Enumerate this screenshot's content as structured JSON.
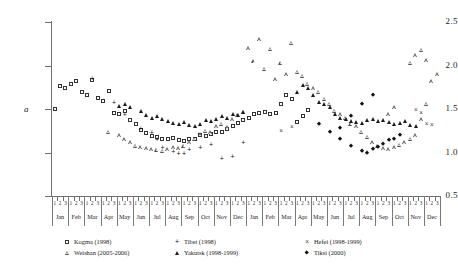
{
  "chart_data": {
    "type": "scatter",
    "title": "",
    "xlabel": "",
    "ylabel": "a",
    "ylim": [
      0.5,
      2.5
    ],
    "ytick_labels": [
      "0.5",
      "1.0",
      "1.5",
      "2.0",
      "2.5"
    ],
    "ytick_values": [
      0.5,
      1.0,
      1.5,
      2.0,
      2.5
    ],
    "grid": false,
    "legend_position": "below-axes",
    "x_axis": {
      "type": "categorical-decades",
      "decade_labels": [
        "1",
        "2",
        "3"
      ],
      "months": [
        "Jan",
        "Feb",
        "Mar",
        "Apr",
        "May",
        "Jun",
        "Jul",
        "Aug",
        "Sep",
        "Oct",
        "Nov",
        "Dec",
        "Jan",
        "Feb",
        "Mar",
        "Apr",
        "May",
        "Jun",
        "Jul",
        "Aug",
        "Sep",
        "Oct",
        "Nov",
        "Dec"
      ],
      "n_months": 24,
      "decades_per_month": 3,
      "total_slots": 72
    },
    "series": [
      {
        "name": "Kogma (1998)",
        "marker": "open-square",
        "points": [
          [
            0,
            1.5
          ],
          [
            1,
            1.76
          ],
          [
            2,
            1.74
          ],
          [
            3,
            1.79
          ],
          [
            4,
            1.82
          ],
          [
            5,
            1.7
          ],
          [
            6,
            1.66
          ],
          [
            7,
            1.83
          ],
          [
            8,
            1.63
          ],
          [
            9,
            1.59
          ],
          [
            10,
            1.71
          ],
          [
            11,
            1.45
          ],
          [
            12,
            1.44
          ],
          [
            13,
            1.48
          ],
          [
            14,
            1.37
          ],
          [
            15,
            1.33
          ],
          [
            16,
            1.26
          ],
          [
            17,
            1.22
          ],
          [
            18,
            1.19
          ],
          [
            19,
            1.18
          ],
          [
            20,
            1.16
          ],
          [
            21,
            1.15
          ],
          [
            22,
            1.17
          ],
          [
            23,
            1.14
          ],
          [
            24,
            1.13
          ],
          [
            25,
            1.16
          ],
          [
            26,
            1.15
          ],
          [
            27,
            1.2
          ],
          [
            28,
            1.19
          ],
          [
            29,
            1.21
          ],
          [
            30,
            1.24
          ],
          [
            31,
            1.23
          ],
          [
            32,
            1.27
          ],
          [
            33,
            1.31
          ],
          [
            34,
            1.34
          ],
          [
            35,
            1.37
          ],
          [
            36,
            1.4
          ],
          [
            37,
            1.44
          ],
          [
            38,
            1.45
          ],
          [
            39,
            1.46
          ],
          [
            40,
            1.44
          ],
          [
            41,
            1.45
          ],
          [
            42,
            1.56
          ],
          [
            43,
            1.66
          ],
          [
            44,
            1.62
          ],
          [
            45,
            1.35
          ],
          [
            46,
            1.42
          ],
          [
            47,
            1.49
          ]
        ]
      },
      {
        "name": "Weishan (2005-2006)",
        "marker": "open-triangle",
        "points": [
          [
            10,
            1.24
          ],
          [
            12,
            1.2
          ],
          [
            13,
            1.15
          ],
          [
            14,
            1.12
          ],
          [
            15,
            1.08
          ],
          [
            16,
            1.06
          ],
          [
            17,
            1.05
          ],
          [
            18,
            1.04
          ],
          [
            19,
            1.03
          ],
          [
            20,
            1.02
          ],
          [
            21,
            1.04
          ],
          [
            22,
            1.06
          ],
          [
            23,
            1.05
          ],
          [
            24,
            1.08
          ],
          [
            25,
            1.12
          ],
          [
            26,
            1.16
          ],
          [
            27,
            1.21
          ],
          [
            28,
            1.25
          ],
          [
            29,
            1.23
          ],
          [
            30,
            1.3
          ],
          [
            31,
            1.33
          ],
          [
            32,
            1.29
          ],
          [
            33,
            1.38
          ],
          [
            34,
            1.43
          ],
          [
            35,
            1.47
          ],
          [
            36,
            2.2
          ],
          [
            37,
            2.05
          ],
          [
            38,
            2.3
          ],
          [
            39,
            1.96
          ],
          [
            40,
            2.19
          ],
          [
            41,
            1.84
          ],
          [
            42,
            2.03
          ],
          [
            43,
            1.9
          ],
          [
            44,
            2.26
          ],
          [
            45,
            1.93
          ],
          [
            46,
            1.88
          ],
          [
            47,
            1.79
          ],
          [
            48,
            1.74
          ],
          [
            49,
            1.7
          ],
          [
            50,
            1.62
          ],
          [
            51,
            1.56
          ],
          [
            52,
            1.48
          ],
          [
            53,
            1.44
          ],
          [
            54,
            1.4
          ],
          [
            55,
            1.33
          ],
          [
            56,
            1.3
          ],
          [
            57,
            1.24
          ],
          [
            58,
            1.18
          ],
          [
            59,
            1.12
          ],
          [
            60,
            1.08
          ],
          [
            61,
            1.05
          ],
          [
            62,
            1.04
          ],
          [
            63,
            1.06
          ],
          [
            64,
            1.09
          ],
          [
            65,
            1.12
          ],
          [
            66,
            1.16
          ],
          [
            67,
            1.2
          ],
          [
            68,
            1.38
          ],
          [
            69,
            1.56
          ],
          [
            70,
            1.82
          ],
          [
            71,
            1.9
          ],
          [
            62,
            1.44
          ],
          [
            63,
            1.52
          ],
          [
            66,
            2.03
          ],
          [
            67,
            2.12
          ],
          [
            68,
            2.18
          ],
          [
            69,
            2.06
          ]
        ]
      },
      {
        "name": "Tibet (1998)",
        "marker": "plus",
        "points": [
          [
            7,
            1.86
          ],
          [
            11,
            1.58
          ],
          [
            13,
            1.44
          ],
          [
            16,
            1.28
          ],
          [
            18,
            1.24
          ],
          [
            19,
            1.15
          ],
          [
            20,
            1.06
          ],
          [
            22,
            1.02
          ],
          [
            23,
            0.99
          ],
          [
            24,
            1.0
          ],
          [
            25,
            1.04
          ],
          [
            27,
            1.06
          ],
          [
            29,
            1.1
          ],
          [
            31,
            0.94
          ],
          [
            33,
            0.96
          ],
          [
            35,
            1.12
          ]
        ]
      },
      {
        "name": "Yakutsk (1998-1999)",
        "marker": "filled-triangle",
        "points": [
          [
            12,
            1.54
          ],
          [
            13,
            1.56
          ],
          [
            14,
            1.52
          ],
          [
            16,
            1.48
          ],
          [
            17,
            1.43
          ],
          [
            18,
            1.4
          ],
          [
            19,
            1.42
          ],
          [
            20,
            1.38
          ],
          [
            21,
            1.36
          ],
          [
            22,
            1.34
          ],
          [
            23,
            1.33
          ],
          [
            24,
            1.35
          ],
          [
            25,
            1.32
          ],
          [
            26,
            1.3
          ],
          [
            27,
            1.33
          ],
          [
            28,
            1.37
          ],
          [
            29,
            1.36
          ],
          [
            30,
            1.38
          ],
          [
            31,
            1.42
          ],
          [
            32,
            1.4
          ],
          [
            33,
            1.44
          ],
          [
            34,
            1.43
          ],
          [
            35,
            1.46
          ],
          [
            45,
            1.7
          ],
          [
            46,
            1.78
          ],
          [
            47,
            1.74
          ],
          [
            48,
            1.66
          ],
          [
            49,
            1.58
          ],
          [
            50,
            1.56
          ],
          [
            51,
            1.52
          ],
          [
            52,
            1.44
          ],
          [
            53,
            1.4
          ],
          [
            54,
            1.38
          ],
          [
            55,
            1.36
          ],
          [
            56,
            1.35
          ],
          [
            57,
            1.34
          ],
          [
            58,
            1.37
          ],
          [
            59,
            1.38
          ],
          [
            60,
            1.36
          ],
          [
            61,
            1.37
          ],
          [
            62,
            1.35
          ],
          [
            63,
            1.33
          ],
          [
            64,
            1.34
          ],
          [
            65,
            1.36
          ],
          [
            66,
            1.32
          ],
          [
            67,
            1.3
          ]
        ]
      },
      {
        "name": "Hefei (1998-1999)",
        "marker": "cross",
        "points": [
          [
            42,
            1.26
          ],
          [
            44,
            1.3
          ],
          [
            67,
            1.5
          ],
          [
            68,
            1.46
          ],
          [
            69,
            1.34
          ],
          [
            70,
            1.33
          ]
        ]
      },
      {
        "name": "Tiksi (2000)",
        "marker": "filled-diamond",
        "points": [
          [
            49,
            1.33
          ],
          [
            51,
            1.24
          ],
          [
            53,
            1.16
          ],
          [
            55,
            1.08
          ],
          [
            57,
            1.02
          ],
          [
            58,
            1.0
          ],
          [
            59,
            1.04
          ],
          [
            60,
            1.06
          ],
          [
            61,
            1.1
          ],
          [
            62,
            1.14
          ],
          [
            63,
            1.16
          ],
          [
            64,
            1.2
          ],
          [
            55,
            1.42
          ],
          [
            57,
            1.56
          ],
          [
            59,
            1.66
          ],
          [
            53,
            1.28
          ]
        ]
      }
    ]
  },
  "legend": {
    "items": [
      {
        "label": "Kogma (1998)",
        "marker": "open-square"
      },
      {
        "label": "Tibet (1998)",
        "marker": "plus"
      },
      {
        "label": "Hefei (1998-1999)",
        "marker": "cross"
      },
      {
        "label": "Weishan (2005-2006)",
        "marker": "open-triangle"
      },
      {
        "label": "Yakutsk (1998-1999)",
        "marker": "filled-triangle"
      },
      {
        "label": "Tiksi (2000)",
        "marker": "filled-diamond"
      }
    ]
  },
  "colors": {
    "axis": "#6f6f6f",
    "marker_open": "#333333",
    "marker_fill": "#1a1a1a",
    "background": "#ffffff"
  }
}
